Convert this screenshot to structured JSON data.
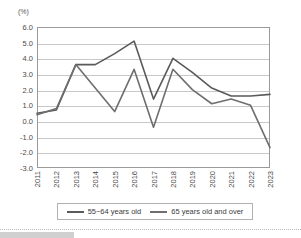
{
  "chart": {
    "unit_label": "(%)",
    "y_ticks": [
      "6.0",
      "5.0",
      "4.0",
      "3.0",
      "2.0",
      "1.0",
      "0.0",
      "-1.0",
      "-2.0",
      "-3.0"
    ],
    "legend": {
      "items": [
        {
          "label": "55~64 years old",
          "color": "#5a5a5a"
        },
        {
          "label": "65 years old and over",
          "color": "#6e6e6e"
        }
      ]
    }
  },
  "chart_data": {
    "type": "line",
    "title": "",
    "subtitle": "",
    "xlabel": "",
    "ylabel": "(%)",
    "ylim": [
      -3.0,
      6.0
    ],
    "ytick_step": 1.0,
    "grid": true,
    "legend_position": "bottom",
    "categories": [
      "2011",
      "2012",
      "2013",
      "2014",
      "2015",
      "2016",
      "2017",
      "2018",
      "2019",
      "2020",
      "2021",
      "2022",
      "2023"
    ],
    "series": [
      {
        "name": "55~64 years old",
        "color": "#5a5a5a",
        "values": [
          0.5,
          0.7,
          3.6,
          3.6,
          4.3,
          5.1,
          1.4,
          4.0,
          3.1,
          2.1,
          1.6,
          1.6,
          1.7
        ]
      },
      {
        "name": "65 years old and over",
        "color": "#6e6e6e",
        "values": [
          0.4,
          0.8,
          3.6,
          2.1,
          0.6,
          3.3,
          -0.4,
          3.3,
          2.0,
          1.1,
          1.4,
          1.0,
          -1.7
        ]
      }
    ]
  }
}
